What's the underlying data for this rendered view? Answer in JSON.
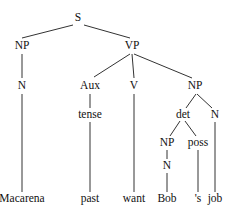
{
  "diagram": {
    "type": "syntax-tree",
    "nodes": [
      {
        "id": "S",
        "label": "S",
        "x": 78,
        "y": 18
      },
      {
        "id": "NP1",
        "label": "NP",
        "x": 22,
        "y": 46
      },
      {
        "id": "VP",
        "label": "VP",
        "x": 132,
        "y": 46
      },
      {
        "id": "N1",
        "label": "N",
        "x": 22,
        "y": 86
      },
      {
        "id": "Aux",
        "label": "Aux",
        "x": 90,
        "y": 86
      },
      {
        "id": "V",
        "label": "V",
        "x": 134,
        "y": 86
      },
      {
        "id": "NP2",
        "label": "NP",
        "x": 195,
        "y": 86
      },
      {
        "id": "tense",
        "label": "tense",
        "x": 90,
        "y": 115
      },
      {
        "id": "det",
        "label": "det",
        "x": 183,
        "y": 115
      },
      {
        "id": "N3",
        "label": "N",
        "x": 215,
        "y": 115
      },
      {
        "id": "NP3",
        "label": "NP",
        "x": 167,
        "y": 143
      },
      {
        "id": "poss",
        "label": "poss",
        "x": 198,
        "y": 143
      },
      {
        "id": "N2",
        "label": "N",
        "x": 167,
        "y": 166
      },
      {
        "id": "Macarena",
        "label": "Macarena",
        "x": 22,
        "y": 199
      },
      {
        "id": "past",
        "label": "past",
        "x": 90,
        "y": 199
      },
      {
        "id": "want",
        "label": "want",
        "x": 134,
        "y": 199
      },
      {
        "id": "Bob",
        "label": "Bob",
        "x": 167,
        "y": 199
      },
      {
        "id": "s",
        "label": "'s",
        "x": 198,
        "y": 199
      },
      {
        "id": "job",
        "label": "job",
        "x": 215,
        "y": 199
      }
    ],
    "edges": [
      {
        "x1": 73,
        "y1": 25,
        "x2": 22,
        "y2": 38
      },
      {
        "x1": 84,
        "y1": 25,
        "x2": 130,
        "y2": 38
      },
      {
        "x1": 22,
        "y1": 54,
        "x2": 22,
        "y2": 78
      },
      {
        "x1": 130,
        "y1": 54,
        "x2": 94,
        "y2": 77
      },
      {
        "x1": 132,
        "y1": 54,
        "x2": 134,
        "y2": 78
      },
      {
        "x1": 134,
        "y1": 54,
        "x2": 192,
        "y2": 78
      },
      {
        "x1": 22,
        "y1": 94,
        "x2": 22,
        "y2": 192
      },
      {
        "x1": 90,
        "y1": 94,
        "x2": 90,
        "y2": 108
      },
      {
        "x1": 90,
        "y1": 122,
        "x2": 90,
        "y2": 192
      },
      {
        "x1": 134,
        "y1": 94,
        "x2": 134,
        "y2": 192
      },
      {
        "x1": 196,
        "y1": 94,
        "x2": 186,
        "y2": 108
      },
      {
        "x1": 197,
        "y1": 94,
        "x2": 212,
        "y2": 108
      },
      {
        "x1": 215,
        "y1": 122,
        "x2": 215,
        "y2": 192
      },
      {
        "x1": 180,
        "y1": 121,
        "x2": 170,
        "y2": 136
      },
      {
        "x1": 185,
        "y1": 121,
        "x2": 196,
        "y2": 136
      },
      {
        "x1": 167,
        "y1": 150,
        "x2": 167,
        "y2": 159
      },
      {
        "x1": 167,
        "y1": 173,
        "x2": 167,
        "y2": 192
      },
      {
        "x1": 198,
        "y1": 150,
        "x2": 198,
        "y2": 192
      }
    ]
  }
}
